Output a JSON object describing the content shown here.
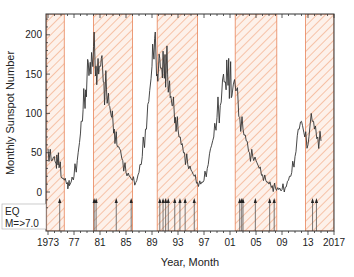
{
  "chart_data": {
    "type": "line",
    "title": "",
    "xlabel": "Year, Month",
    "ylabel": "Monthly Sunspot Number",
    "xlim": [
      1973,
      2017
    ],
    "ylim": [
      -20,
      220
    ],
    "x_ticks": [
      1973,
      1977,
      1981,
      1985,
      1989,
      1993,
      1997,
      2001,
      2005,
      2009,
      2013,
      2017
    ],
    "x_tick_labels": [
      "1973",
      "77",
      "81",
      "85",
      "89",
      "93",
      "97",
      "01",
      "05",
      "09",
      "13",
      "2017"
    ],
    "y_ticks": [
      0,
      50,
      100,
      150,
      200
    ],
    "y_tick_labels": [
      "0",
      "50",
      "100",
      "150",
      "200"
    ],
    "grid": false,
    "series": [
      {
        "name": "Monthly Sunspot Number",
        "color": "#333333",
        "x": [
          1973.0,
          1973.5,
          1974.0,
          1974.3,
          1974.6,
          1975.0,
          1975.5,
          1976.0,
          1976.3,
          1976.6,
          1977.0,
          1977.5,
          1978.0,
          1978.4,
          1978.8,
          1979.2,
          1979.6,
          1980.0,
          1980.4,
          1980.8,
          1981.2,
          1981.6,
          1982.0,
          1982.4,
          1982.8,
          1983.2,
          1983.6,
          1984.0,
          1984.5,
          1985.0,
          1985.5,
          1986.0,
          1986.5,
          1987.0,
          1987.5,
          1988.0,
          1988.5,
          1989.0,
          1989.4,
          1989.8,
          1990.2,
          1990.6,
          1991.0,
          1991.4,
          1991.8,
          1992.2,
          1992.6,
          1993.0,
          1993.5,
          1994.0,
          1994.5,
          1995.0,
          1995.5,
          1996.0,
          1996.5,
          1997.0,
          1997.5,
          1998.0,
          1998.5,
          1999.0,
          1999.5,
          2000.0,
          2000.4,
          2000.8,
          2001.2,
          2001.6,
          2002.0,
          2002.5,
          2003.0,
          2003.5,
          2004.0,
          2004.5,
          2005.0,
          2005.5,
          2006.0,
          2006.5,
          2007.0,
          2007.5,
          2008.0,
          2008.5,
          2009.0,
          2009.5,
          2010.0,
          2010.5,
          2011.0,
          2011.5,
          2012.0,
          2012.5,
          2013.0,
          2013.5,
          2014.0,
          2014.5,
          2015.0
        ],
        "values": [
          55,
          40,
          45,
          30,
          50,
          20,
          15,
          12,
          8,
          14,
          20,
          40,
          75,
          105,
          130,
          165,
          150,
          185,
          160,
          150,
          170,
          140,
          130,
          110,
          95,
          80,
          60,
          55,
          40,
          25,
          20,
          15,
          12,
          25,
          45,
          80,
          115,
          160,
          195,
          150,
          170,
          145,
          175,
          150,
          120,
          110,
          95,
          80,
          60,
          50,
          35,
          28,
          20,
          12,
          10,
          15,
          30,
          55,
          70,
          95,
          110,
          150,
          130,
          170,
          120,
          140,
          130,
          95,
          80,
          65,
          50,
          45,
          40,
          30,
          22,
          15,
          10,
          8,
          5,
          3,
          3,
          6,
          15,
          25,
          45,
          80,
          90,
          70,
          60,
          100,
          80,
          70,
          65
        ]
      }
    ],
    "shaded_regions": [
      {
        "start": 1972.8,
        "end": 1975.5,
        "label": "hatched"
      },
      {
        "start": 1980.0,
        "end": 1986.0,
        "label": "hatched"
      },
      {
        "start": 1989.8,
        "end": 1996.0,
        "label": "hatched"
      },
      {
        "start": 2001.8,
        "end": 2008.2,
        "label": "hatched"
      },
      {
        "start": 2012.6,
        "end": 2017.0,
        "label": "hatched"
      }
    ],
    "earthquakes_M7plus": [
      1974.8,
      1980.1,
      1980.4,
      1983.5,
      1985.8,
      1990.2,
      1990.7,
      1991.1,
      1991.5,
      1992.5,
      1993.3,
      1994.1,
      1995.5,
      2002.5,
      2002.8,
      2003.0,
      2004.9,
      2007.1,
      2007.8,
      2013.7,
      2014.3
    ],
    "legend": {
      "entries": [
        "EQ",
        "M=>7.0"
      ],
      "position": "lower-left"
    },
    "annotations": [],
    "colors": {
      "hatch": "#f2a27a",
      "hatch_border": "#e8845a",
      "line": "#333333",
      "axis": "#333333"
    }
  },
  "labels": {
    "xlabel": "Year, Month",
    "ylabel": "Monthly Sunspot Number",
    "legend_line1": "EQ",
    "legend_line2": "M=>7.0"
  }
}
